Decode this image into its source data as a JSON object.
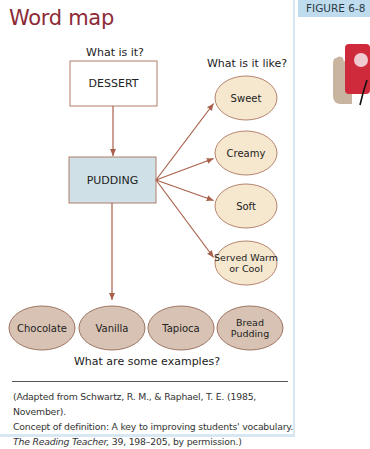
{
  "title": "Word map",
  "figure_label": "FIGURE 6-8",
  "colors": {
    "title": "#8c2a36",
    "arrow": "#a8604a",
    "concept_box_fill": "#cfe1e6",
    "property_oval_fill": "#f6e7cf",
    "example_oval_fill": "#d8c2b3",
    "figure_tab": "#bfdcef"
  },
  "diagram": {
    "question_what": "What is it?",
    "question_like": "What is it like?",
    "question_examples": "What are some examples?",
    "category": "DESSERT",
    "concept": "PUDDING",
    "properties": [
      {
        "lines": [
          "Sweet"
        ]
      },
      {
        "lines": [
          "Creamy"
        ]
      },
      {
        "lines": [
          "Soft"
        ]
      },
      {
        "lines": [
          "Served Warm",
          "or Cool"
        ]
      }
    ],
    "examples": [
      {
        "lines": [
          "Chocolate"
        ]
      },
      {
        "lines": [
          "Vanilla"
        ]
      },
      {
        "lines": [
          "Tapioca"
        ]
      },
      {
        "lines": [
          "Bread",
          "Pudding"
        ]
      }
    ]
  },
  "citation": {
    "line1": "(Adapted from Schwartz, R. M., & Raphael, T. E. (1985, November).",
    "line2": "Concept of definition: A key to improving students' vocabulary.",
    "journal": "The Reading Teacher,",
    "line3_rest": " 39, 198–205, by permission.)"
  }
}
